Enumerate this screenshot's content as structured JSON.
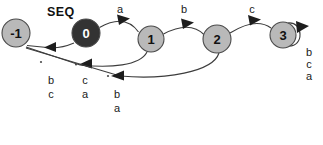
{
  "diagram": {
    "title": "SEQ",
    "title_pos": {
      "x": 47,
      "y": 6
    },
    "background": "#ffffff",
    "node_fill_light": "#b9b9b9",
    "node_fill_dark": "#333333",
    "node_stroke": "#4a4a4a",
    "edge_color": "#3d3d3d",
    "nodes": [
      {
        "id": "n-1",
        "label": "-1",
        "cx": 16,
        "cy": 33,
        "r": 14,
        "fill": "light",
        "text_color": "#111111"
      },
      {
        "id": "n0",
        "label": "0",
        "cx": 86,
        "cy": 33,
        "r": 14,
        "fill": "dark",
        "text_color": "#ffffff"
      },
      {
        "id": "n1",
        "label": "1",
        "cx": 151,
        "cy": 39,
        "r": 13,
        "fill": "light",
        "text_color": "#111111"
      },
      {
        "id": "n2",
        "label": "2",
        "cx": 217,
        "cy": 39,
        "r": 14,
        "fill": "light",
        "text_color": "#111111"
      },
      {
        "id": "n3",
        "label": "3",
        "cx": 283,
        "cy": 35,
        "r": 13,
        "fill": "light",
        "text_color": "#111111"
      }
    ],
    "forward_edges": [
      {
        "id": "e-0-1",
        "from": "0",
        "to": "1",
        "label": "a",
        "label_x": 114,
        "label_y": 3
      },
      {
        "id": "e-1-2",
        "from": "1",
        "to": "2",
        "label": "b",
        "label_x": 178,
        "label_y": 3
      },
      {
        "id": "e-2-3",
        "from": "2",
        "to": "3",
        "label": "c",
        "label_x": 246,
        "label_y": 3
      }
    ],
    "self_loop": {
      "id": "e-3-3",
      "node": "3",
      "labels": [
        "b",
        "c",
        "a"
      ],
      "label_x": 303,
      "label_y_start": 46,
      "label_line_height": 12
    },
    "back_edges": [
      {
        "id": "e-0-neg1",
        "from": "0",
        "to": "-1",
        "labels": [
          "b",
          "c"
        ],
        "label_x": 45,
        "label_y_start": 74,
        "label_line_height": 14
      },
      {
        "id": "e-1-neg1",
        "from": "1",
        "to": "-1",
        "labels": [
          "c",
          "a"
        ],
        "label_x": 79,
        "label_y_start": 74,
        "label_line_height": 14
      },
      {
        "id": "e-2-neg1",
        "from": "2",
        "to": "-1",
        "labels": [
          "b",
          "a"
        ],
        "label_x": 111,
        "label_y_start": 88,
        "label_line_height": 14
      }
    ]
  }
}
